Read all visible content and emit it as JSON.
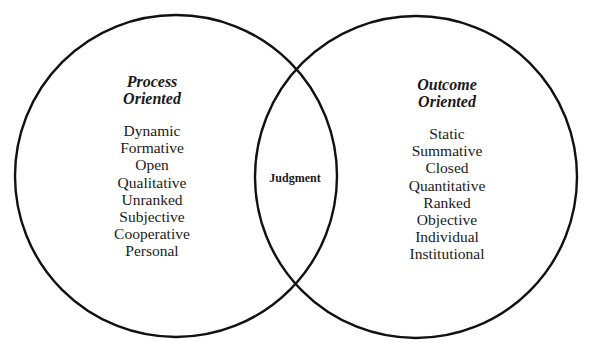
{
  "diagram": {
    "type": "venn",
    "left_set": {
      "title_line1": "Process",
      "title_line2": "Oriented",
      "items": [
        "Dynamic",
        "Formative",
        "Open",
        "Qualitative",
        "Unranked",
        "Subjective",
        "Cooperative",
        "Personal"
      ]
    },
    "right_set": {
      "title_line1": "Outcome",
      "title_line2": "Oriented",
      "items": [
        "Static",
        "Summative",
        "Closed",
        "Quantitative",
        "Ranked",
        "Objective",
        "Individual",
        "Institutional"
      ]
    },
    "intersection": {
      "label": "Judgment"
    },
    "stroke_color": "#111111"
  }
}
